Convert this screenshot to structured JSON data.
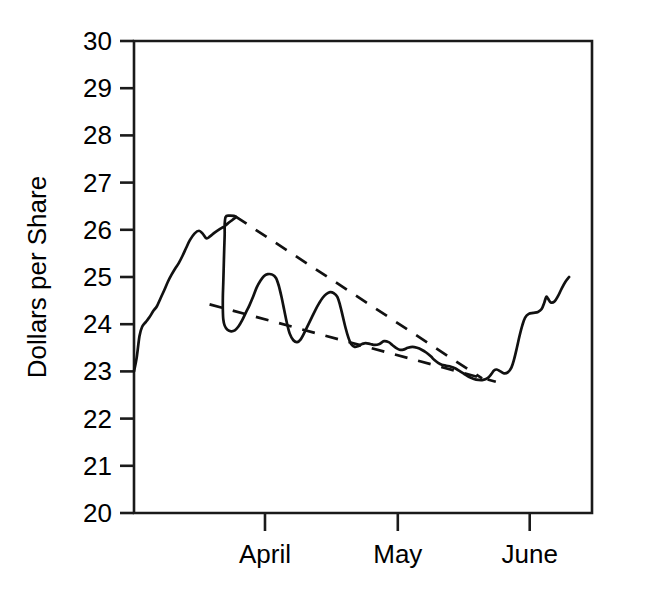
{
  "chart_data": {
    "type": "line",
    "title": "",
    "subtitle": "",
    "xlabel": "",
    "ylabel": "Dollars per Share",
    "ylim": [
      20,
      30
    ],
    "y_ticks": [
      20,
      21,
      22,
      23,
      24,
      25,
      26,
      27,
      28,
      29,
      30
    ],
    "y_tick_labels": [
      "20",
      "21",
      "22",
      "23",
      "24",
      "25",
      "26",
      "27",
      "28",
      "29",
      "30"
    ],
    "x_tick_labels": [
      "April",
      "May",
      "June"
    ],
    "x_tick_positions": [
      0.286,
      0.576,
      0.864
    ],
    "xlim": [
      0,
      1
    ],
    "grid": false,
    "legend": "none",
    "line_color": "#111111",
    "axis_color": "#1a1a1a",
    "background_color": "#ffffff",
    "series": [
      {
        "name": "Price",
        "style": "solid",
        "points": [
          [
            0.0,
            23.0
          ],
          [
            0.006,
            23.3
          ],
          [
            0.012,
            23.75
          ],
          [
            0.018,
            23.95
          ],
          [
            0.026,
            24.05
          ],
          [
            0.034,
            24.15
          ],
          [
            0.042,
            24.28
          ],
          [
            0.05,
            24.38
          ],
          [
            0.058,
            24.55
          ],
          [
            0.066,
            24.72
          ],
          [
            0.074,
            24.9
          ],
          [
            0.082,
            25.05
          ],
          [
            0.09,
            25.18
          ],
          [
            0.098,
            25.3
          ],
          [
            0.106,
            25.45
          ],
          [
            0.114,
            25.62
          ],
          [
            0.122,
            25.78
          ],
          [
            0.132,
            25.92
          ],
          [
            0.142,
            25.98
          ],
          [
            0.15,
            25.92
          ],
          [
            0.158,
            25.82
          ],
          [
            0.166,
            25.86
          ],
          [
            0.176,
            25.94
          ],
          [
            0.188,
            26.02
          ],
          [
            0.198,
            26.08
          ],
          [
            0.208,
            26.16
          ],
          [
            0.216,
            26.22
          ],
          [
            0.222,
            26.28
          ],
          [
            0.206,
            26.3
          ],
          [
            0.2,
            26.27
          ],
          [
            0.198,
            26.12
          ],
          [
            0.198,
            25.9
          ],
          [
            0.197,
            25.6
          ],
          [
            0.196,
            25.25
          ],
          [
            0.195,
            24.9
          ],
          [
            0.194,
            24.58
          ],
          [
            0.194,
            24.3
          ],
          [
            0.195,
            24.1
          ],
          [
            0.198,
            23.97
          ],
          [
            0.204,
            23.88
          ],
          [
            0.212,
            23.85
          ],
          [
            0.22,
            23.87
          ],
          [
            0.228,
            23.95
          ],
          [
            0.236,
            24.08
          ],
          [
            0.244,
            24.24
          ],
          [
            0.252,
            24.4
          ],
          [
            0.26,
            24.58
          ],
          [
            0.268,
            24.78
          ],
          [
            0.276,
            24.92
          ],
          [
            0.284,
            25.02
          ],
          [
            0.292,
            25.06
          ],
          [
            0.302,
            25.05
          ],
          [
            0.31,
            24.98
          ],
          [
            0.316,
            24.82
          ],
          [
            0.322,
            24.58
          ],
          [
            0.328,
            24.3
          ],
          [
            0.334,
            24.02
          ],
          [
            0.34,
            23.8
          ],
          [
            0.348,
            23.66
          ],
          [
            0.356,
            23.62
          ],
          [
            0.364,
            23.68
          ],
          [
            0.372,
            23.82
          ],
          [
            0.38,
            23.98
          ],
          [
            0.388,
            24.14
          ],
          [
            0.396,
            24.3
          ],
          [
            0.404,
            24.44
          ],
          [
            0.412,
            24.56
          ],
          [
            0.42,
            24.64
          ],
          [
            0.428,
            24.68
          ],
          [
            0.436,
            24.66
          ],
          [
            0.444,
            24.58
          ],
          [
            0.45,
            24.4
          ],
          [
            0.456,
            24.16
          ],
          [
            0.462,
            23.92
          ],
          [
            0.468,
            23.72
          ],
          [
            0.474,
            23.58
          ],
          [
            0.482,
            23.52
          ],
          [
            0.49,
            23.54
          ],
          [
            0.498,
            23.58
          ],
          [
            0.506,
            23.6
          ],
          [
            0.516,
            23.58
          ],
          [
            0.526,
            23.56
          ],
          [
            0.536,
            23.58
          ],
          [
            0.546,
            23.64
          ],
          [
            0.556,
            23.62
          ],
          [
            0.564,
            23.56
          ],
          [
            0.572,
            23.5
          ],
          [
            0.58,
            23.46
          ],
          [
            0.588,
            23.46
          ],
          [
            0.598,
            23.5
          ],
          [
            0.608,
            23.52
          ],
          [
            0.618,
            23.5
          ],
          [
            0.628,
            23.46
          ],
          [
            0.638,
            23.4
          ],
          [
            0.648,
            23.32
          ],
          [
            0.656,
            23.24
          ],
          [
            0.664,
            23.18
          ],
          [
            0.672,
            23.14
          ],
          [
            0.682,
            23.12
          ],
          [
            0.692,
            23.1
          ],
          [
            0.702,
            23.06
          ],
          [
            0.712,
            23.0
          ],
          [
            0.722,
            22.94
          ],
          [
            0.732,
            22.88
          ],
          [
            0.742,
            22.84
          ],
          [
            0.752,
            22.82
          ],
          [
            0.762,
            22.82
          ],
          [
            0.772,
            22.86
          ],
          [
            0.78,
            22.94
          ],
          [
            0.786,
            23.02
          ],
          [
            0.792,
            23.04
          ],
          [
            0.8,
            23.0
          ],
          [
            0.808,
            22.96
          ],
          [
            0.816,
            22.98
          ],
          [
            0.824,
            23.08
          ],
          [
            0.83,
            23.26
          ],
          [
            0.836,
            23.5
          ],
          [
            0.842,
            23.76
          ],
          [
            0.848,
            23.98
          ],
          [
            0.854,
            24.14
          ],
          [
            0.862,
            24.22
          ],
          [
            0.872,
            24.24
          ],
          [
            0.882,
            24.26
          ],
          [
            0.89,
            24.32
          ],
          [
            0.896,
            24.46
          ],
          [
            0.9,
            24.58
          ],
          [
            0.904,
            24.54
          ],
          [
            0.91,
            24.46
          ],
          [
            0.918,
            24.48
          ],
          [
            0.926,
            24.6
          ],
          [
            0.934,
            24.76
          ],
          [
            0.942,
            24.9
          ],
          [
            0.95,
            25.0
          ]
        ]
      },
      {
        "name": "Upper trendline",
        "style": "dashed",
        "points": [
          [
            0.222,
            26.28
          ],
          [
            0.76,
            22.85
          ]
        ]
      },
      {
        "name": "Lower trendline",
        "style": "dashed",
        "points": [
          [
            0.165,
            24.42
          ],
          [
            0.79,
            22.78
          ]
        ]
      }
    ],
    "annotations": [
      {
        "name": "descending-wedge",
        "description": "Two converging dashed trendlines forming a descending wedge pattern that the price breaks out of to the upside."
      }
    ]
  },
  "axes": {
    "y_axis_title": "Dollars per Share",
    "plot_left_px": 134,
    "plot_right_px": 592,
    "plot_top_px": 41,
    "plot_bottom_px": 513
  }
}
